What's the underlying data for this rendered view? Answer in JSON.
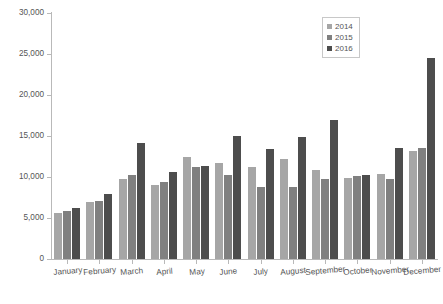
{
  "chart_data": {
    "type": "bar",
    "title": "",
    "subtitle": "",
    "xlabel": "",
    "ylabel": "",
    "ylim": [
      0,
      30000
    ],
    "ytick_values": [
      0,
      5000,
      10000,
      15000,
      20000,
      25000,
      30000
    ],
    "ytick_labels": [
      "0",
      "5,000",
      "10,000",
      "15,000",
      "20,000",
      "25,000",
      "30,000"
    ],
    "grid": false,
    "legend_position": "top-right",
    "categories": [
      "January",
      "February",
      "March",
      "April",
      "May",
      "June",
      "July",
      "August",
      "September",
      "October",
      "November",
      "December"
    ],
    "series": [
      {
        "name": "2014",
        "color": "#a6a6a6",
        "values": [
          5600,
          7000,
          9700,
          9000,
          12500,
          11700,
          11200,
          12200,
          10900,
          9900,
          10400,
          13200
        ]
      },
      {
        "name": "2015",
        "color": "#808080",
        "values": [
          5900,
          7100,
          10200,
          9400,
          11200,
          10200,
          8800,
          8800,
          9800,
          10100,
          9700,
          13500
        ]
      },
      {
        "name": "2016",
        "color": "#4d4d4d",
        "values": [
          6200,
          7900,
          14100,
          10600,
          11400,
          15000,
          13400,
          14900,
          16900,
          10300,
          13500,
          24500
        ]
      }
    ]
  }
}
